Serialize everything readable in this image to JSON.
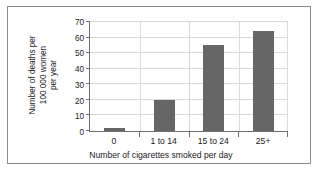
{
  "chart_data": {
    "type": "bar",
    "title": "",
    "categories": [
      "0",
      "1 to 14",
      "15 to 24",
      "25+"
    ],
    "values": [
      2,
      20,
      55,
      64
    ],
    "series": [
      {
        "name": "Number of deaths per 100 000 women per year",
        "values": [
          2,
          20,
          55,
          64
        ]
      }
    ],
    "xlabel": "Number of cigarettes smoked per day",
    "ylabel": "Number of deaths per 100 000 women per year",
    "ylabel_lines": [
      "Number of deaths per",
      "100 000 women",
      "per year"
    ],
    "ylim": [
      0,
      70
    ],
    "yticks": [
      0,
      10,
      20,
      30,
      40,
      50,
      60,
      70
    ],
    "ytick_labels": [
      "0",
      "10",
      "20",
      "30",
      "40",
      "50",
      "60",
      "70"
    ],
    "grid": true,
    "grid_axis": "both",
    "legend": false,
    "legend_position": "none",
    "bar_color": "#666666",
    "axis_color": "#6f6f6f",
    "grid_color": "#d9d9d9",
    "frame_color": "#8d8d8d",
    "background_color": "#ffffff"
  }
}
